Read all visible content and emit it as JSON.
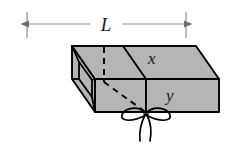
{
  "figure": {
    "background_color": "#ffffff",
    "face_fill_color": "#b5b5b5",
    "edge_color": "#000000",
    "dimension_line_color": "#767676",
    "label_color": "#1a1a1a",
    "dimension": {
      "name": "length-dimension",
      "label": "L",
      "style": "double-headed-arrow",
      "left_tick_x": 27,
      "right_tick_x": 186,
      "line_y": 24,
      "tick_top_y": 12,
      "tick_bottom_y": 38
    },
    "labels": [
      {
        "name": "edge-label-x",
        "text": "x",
        "x": 148,
        "y": 64
      },
      {
        "name": "edge-label-y",
        "text": "y",
        "x": 166,
        "y": 101
      }
    ],
    "hidden_edges": [
      {
        "name": "hidden-vertical-edge",
        "style": "dashed",
        "from": [
          104,
          48
        ],
        "to": [
          104,
          82
        ]
      },
      {
        "name": "hidden-diagonal-edge",
        "style": "dashed",
        "from": [
          104,
          82
        ],
        "to": [
          146,
          112
        ]
      }
    ],
    "string": {
      "name": "string-bow",
      "type": "bow-knot",
      "center": [
        146,
        114
      ],
      "loops": 2,
      "tails": 2
    },
    "solid": {
      "name": "rectangular-box",
      "open_end": "left",
      "top_face": [
        [
          72,
          46
        ],
        [
          196,
          46
        ],
        [
          219,
          79
        ],
        [
          95,
          79
        ]
      ],
      "front_face": [
        [
          95,
          79
        ],
        [
          219,
          79
        ],
        [
          219,
          112
        ],
        [
          95,
          112
        ]
      ],
      "left_end_outer": [
        [
          72,
          46
        ],
        [
          95,
          79
        ],
        [
          95,
          112
        ],
        [
          72,
          79
        ]
      ],
      "right_band_edge_x": 146
    }
  }
}
